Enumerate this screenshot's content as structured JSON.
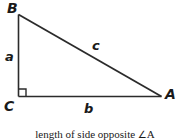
{
  "figure": {
    "stroke_color": "#2b2b2b",
    "background_color": "#ffffff",
    "vertices": [
      {
        "id": "B",
        "label": "B",
        "x": 18,
        "y": 14
      },
      {
        "id": "C",
        "label": "C",
        "x": 18,
        "y": 96
      },
      {
        "id": "A",
        "label": "A",
        "x": 161,
        "y": 96
      }
    ],
    "sides": [
      {
        "id": "a",
        "label": "a",
        "from": "B",
        "to": "C",
        "description": "vertical leg"
      },
      {
        "id": "b",
        "label": "b",
        "from": "C",
        "to": "A",
        "description": "horizontal leg"
      },
      {
        "id": "c",
        "label": "c",
        "from": "B",
        "to": "A",
        "description": "hypotenuse"
      }
    ],
    "right_angle": {
      "at_vertex": "C",
      "marker": "right-angle-square",
      "size": 7
    },
    "caption": {
      "text": "length of side opposite ",
      "angle_symbol": "∠",
      "angle_name": "A"
    }
  }
}
